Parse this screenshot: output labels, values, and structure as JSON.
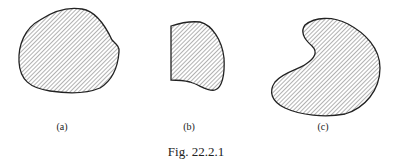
{
  "figure": {
    "caption": "Fig. 22.2.1",
    "hatch_color": "#555555",
    "outline_color": "#222222",
    "panels": [
      {
        "id": "a",
        "label": "(a)"
      },
      {
        "id": "b",
        "label": "(b)"
      },
      {
        "id": "c",
        "label": "(c)"
      }
    ]
  }
}
